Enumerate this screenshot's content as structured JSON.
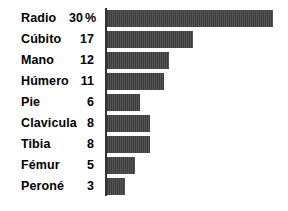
{
  "chart_data": {
    "type": "bar",
    "orientation": "horizontal",
    "title": "",
    "subtitle": "",
    "xlabel": "",
    "ylabel": "",
    "grid": false,
    "legend": null,
    "axis_line": "left-vertical",
    "unit_suffix": "%",
    "unit_shown_on_first_row_only": true,
    "xlim": [
      0,
      30
    ],
    "categories": [
      "Radio",
      "Cúbito",
      "Mano",
      "Húmero",
      "Pie",
      "Clavicula",
      "Tibia",
      "Fémur",
      "Peroné"
    ],
    "values": [
      30,
      17,
      12,
      11,
      6,
      8,
      8,
      5,
      3
    ],
    "value_labels": [
      "30",
      "17",
      "12",
      "11",
      "6",
      "8",
      "8",
      "5",
      "3"
    ],
    "bar_color": "#4a4a4a",
    "background_color": "#ffffff",
    "text_color": "#000000"
  },
  "rows": [
    {
      "label": "Radio",
      "value": "30",
      "unit": "%",
      "bar_px": 166
    },
    {
      "label": "Cúbito",
      "value": "17",
      "unit": "",
      "bar_px": 86
    },
    {
      "label": "Mano",
      "value": "12",
      "unit": "",
      "bar_px": 62
    },
    {
      "label": "Húmero",
      "value": "11",
      "unit": "",
      "bar_px": 57
    },
    {
      "label": "Pie",
      "value": "6",
      "unit": "",
      "bar_px": 33
    },
    {
      "label": "Clavicula",
      "value": "8",
      "unit": "",
      "bar_px": 43
    },
    {
      "label": "Tibia",
      "value": "8",
      "unit": "",
      "bar_px": 43
    },
    {
      "label": "Fémur",
      "value": "5",
      "unit": "",
      "bar_px": 28
    },
    {
      "label": "Peroné",
      "value": "3",
      "unit": "",
      "bar_px": 18
    }
  ]
}
